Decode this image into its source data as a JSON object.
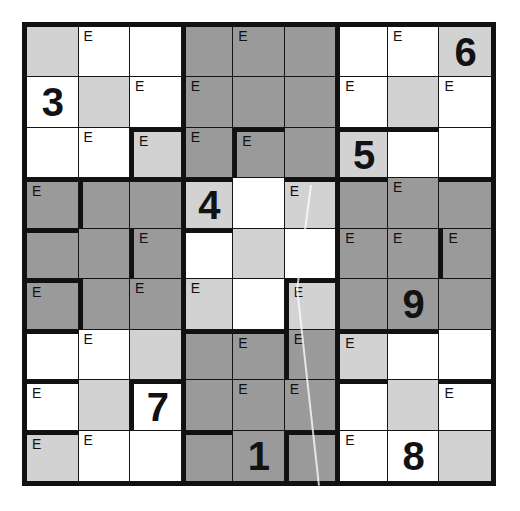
{
  "puzzle": {
    "type": "jigsaw-sudoku",
    "rows": 9,
    "cols": 9,
    "mark_symbol": "E",
    "colors": {
      "grid_line": "#151515",
      "region_border": "#111111",
      "digit": "#121212",
      "shade_white": "#ffffff",
      "shade_light": "#d2d2d2",
      "shade_dark": "#9a9a9a",
      "page_background": "#ffffff"
    },
    "givens": [
      {
        "row": 1,
        "col": 9,
        "value": "6"
      },
      {
        "row": 2,
        "col": 1,
        "value": "3"
      },
      {
        "row": 3,
        "col": 7,
        "value": "5"
      },
      {
        "row": 4,
        "col": 4,
        "value": "4"
      },
      {
        "row": 6,
        "col": 8,
        "value": "9"
      },
      {
        "row": 8,
        "col": 3,
        "value": "7"
      },
      {
        "row": 9,
        "col": 5,
        "value": "1"
      },
      {
        "row": 9,
        "col": 8,
        "value": "8"
      }
    ],
    "cells": [
      [
        {
          "shade": "light",
          "mark": "",
          "value": "",
          "edges": ""
        },
        {
          "shade": "white",
          "mark": "E",
          "value": "",
          "edges": ""
        },
        {
          "shade": "white",
          "mark": "",
          "value": "",
          "edges": ""
        },
        {
          "shade": "dark",
          "mark": "",
          "value": "",
          "edges": "l"
        },
        {
          "shade": "dark",
          "mark": "E",
          "value": "",
          "edges": ""
        },
        {
          "shade": "dark",
          "mark": "",
          "value": "",
          "edges": ""
        },
        {
          "shade": "white",
          "mark": "",
          "value": "",
          "edges": "l"
        },
        {
          "shade": "white",
          "mark": "E",
          "value": "",
          "edges": ""
        },
        {
          "shade": "light",
          "mark": "",
          "value": "6",
          "edges": ""
        }
      ],
      [
        {
          "shade": "white",
          "mark": "",
          "value": "3",
          "edges": ""
        },
        {
          "shade": "light",
          "mark": "",
          "value": "",
          "edges": ""
        },
        {
          "shade": "white",
          "mark": "E",
          "value": "",
          "edges": ""
        },
        {
          "shade": "dark",
          "mark": "E",
          "value": "",
          "edges": "l"
        },
        {
          "shade": "dark",
          "mark": "",
          "value": "",
          "edges": ""
        },
        {
          "shade": "dark",
          "mark": "",
          "value": "",
          "edges": ""
        },
        {
          "shade": "white",
          "mark": "E",
          "value": "",
          "edges": "l"
        },
        {
          "shade": "light",
          "mark": "",
          "value": "",
          "edges": ""
        },
        {
          "shade": "white",
          "mark": "E",
          "value": "",
          "edges": ""
        }
      ],
      [
        {
          "shade": "white",
          "mark": "",
          "value": "",
          "edges": ""
        },
        {
          "shade": "white",
          "mark": "E",
          "value": "",
          "edges": ""
        },
        {
          "shade": "light",
          "mark": "E",
          "value": "",
          "edges": "lt"
        },
        {
          "shade": "dark",
          "mark": "E",
          "value": "",
          "edges": "l"
        },
        {
          "shade": "dark",
          "mark": "E",
          "value": "",
          "edges": "lt"
        },
        {
          "shade": "dark",
          "mark": "",
          "value": "",
          "edges": ""
        },
        {
          "shade": "light",
          "mark": "",
          "value": "5",
          "edges": "lt"
        },
        {
          "shade": "white",
          "mark": "",
          "value": "",
          "edges": "t"
        },
        {
          "shade": "white",
          "mark": "",
          "value": "",
          "edges": ""
        }
      ],
      [
        {
          "shade": "dark",
          "mark": "E",
          "value": "",
          "edges": "t"
        },
        {
          "shade": "dark",
          "mark": "",
          "value": "",
          "edges": "lt"
        },
        {
          "shade": "dark",
          "mark": "",
          "value": "",
          "edges": "t"
        },
        {
          "shade": "light",
          "mark": "",
          "value": "4",
          "edges": "lt"
        },
        {
          "shade": "white",
          "mark": "",
          "value": "",
          "edges": ""
        },
        {
          "shade": "light",
          "mark": "E",
          "value": "",
          "edges": "t"
        },
        {
          "shade": "dark",
          "mark": "",
          "value": "",
          "edges": "lt"
        },
        {
          "shade": "dark",
          "mark": "E",
          "value": "",
          "edges": ""
        },
        {
          "shade": "dark",
          "mark": "",
          "value": "",
          "edges": "t"
        }
      ],
      [
        {
          "shade": "dark",
          "mark": "",
          "value": "",
          "edges": "t"
        },
        {
          "shade": "dark",
          "mark": "",
          "value": "",
          "edges": ""
        },
        {
          "shade": "dark",
          "mark": "E",
          "value": "",
          "edges": "l"
        },
        {
          "shade": "white",
          "mark": "",
          "value": "",
          "edges": "lt"
        },
        {
          "shade": "light",
          "mark": "",
          "value": "",
          "edges": ""
        },
        {
          "shade": "white",
          "mark": "",
          "value": "",
          "edges": ""
        },
        {
          "shade": "dark",
          "mark": "E",
          "value": "",
          "edges": "l"
        },
        {
          "shade": "dark",
          "mark": "E",
          "value": "",
          "edges": ""
        },
        {
          "shade": "dark",
          "mark": "E",
          "value": "",
          "edges": "l"
        }
      ],
      [
        {
          "shade": "dark",
          "mark": "E",
          "value": "",
          "edges": "t"
        },
        {
          "shade": "dark",
          "mark": "",
          "value": "",
          "edges": "l"
        },
        {
          "shade": "dark",
          "mark": "E",
          "value": "",
          "edges": ""
        },
        {
          "shade": "light",
          "mark": "E",
          "value": "",
          "edges": "l"
        },
        {
          "shade": "white",
          "mark": "",
          "value": "",
          "edges": ""
        },
        {
          "shade": "light",
          "mark": "E",
          "value": "",
          "edges": "lt"
        },
        {
          "shade": "dark",
          "mark": "",
          "value": "",
          "edges": "l"
        },
        {
          "shade": "dark",
          "mark": "",
          "value": "9",
          "edges": ""
        },
        {
          "shade": "dark",
          "mark": "",
          "value": "",
          "edges": ""
        }
      ],
      [
        {
          "shade": "white",
          "mark": "",
          "value": "",
          "edges": "t"
        },
        {
          "shade": "white",
          "mark": "E",
          "value": "",
          "edges": ""
        },
        {
          "shade": "light",
          "mark": "",
          "value": "",
          "edges": ""
        },
        {
          "shade": "dark",
          "mark": "",
          "value": "",
          "edges": "lt"
        },
        {
          "shade": "dark",
          "mark": "E",
          "value": "",
          "edges": "t"
        },
        {
          "shade": "dark",
          "mark": "E",
          "value": "",
          "edges": "l"
        },
        {
          "shade": "light",
          "mark": "E",
          "value": "",
          "edges": "lt"
        },
        {
          "shade": "white",
          "mark": "",
          "value": "",
          "edges": "t"
        },
        {
          "shade": "white",
          "mark": "",
          "value": "",
          "edges": ""
        }
      ],
      [
        {
          "shade": "white",
          "mark": "E",
          "value": "",
          "edges": "t"
        },
        {
          "shade": "light",
          "mark": "",
          "value": "",
          "edges": ""
        },
        {
          "shade": "white",
          "mark": "",
          "value": "7",
          "edges": "lt"
        },
        {
          "shade": "dark",
          "mark": "",
          "value": "",
          "edges": "l"
        },
        {
          "shade": "dark",
          "mark": "E",
          "value": "",
          "edges": ""
        },
        {
          "shade": "dark",
          "mark": "E",
          "value": "",
          "edges": ""
        },
        {
          "shade": "white",
          "mark": "",
          "value": "",
          "edges": "lt"
        },
        {
          "shade": "light",
          "mark": "",
          "value": "",
          "edges": ""
        },
        {
          "shade": "white",
          "mark": "E",
          "value": "",
          "edges": "t"
        }
      ],
      [
        {
          "shade": "light",
          "mark": "E",
          "value": "",
          "edges": "t"
        },
        {
          "shade": "white",
          "mark": "E",
          "value": "",
          "edges": ""
        },
        {
          "shade": "white",
          "mark": "",
          "value": "",
          "edges": ""
        },
        {
          "shade": "dark",
          "mark": "",
          "value": "",
          "edges": "lt"
        },
        {
          "shade": "dark",
          "mark": "",
          "value": "1",
          "edges": ""
        },
        {
          "shade": "dark",
          "mark": "",
          "value": "",
          "edges": "lt"
        },
        {
          "shade": "white",
          "mark": "E",
          "value": "",
          "edges": "l"
        },
        {
          "shade": "white",
          "mark": "",
          "value": "8",
          "edges": ""
        },
        {
          "shade": "light",
          "mark": "",
          "value": "",
          "edges": ""
        }
      ]
    ],
    "scratch_marks": [
      {
        "x1": 310,
        "y1": 185,
        "x2": 296,
        "y2": 290
      },
      {
        "x1": 296,
        "y1": 288,
        "x2": 318,
        "y2": 486
      }
    ]
  }
}
